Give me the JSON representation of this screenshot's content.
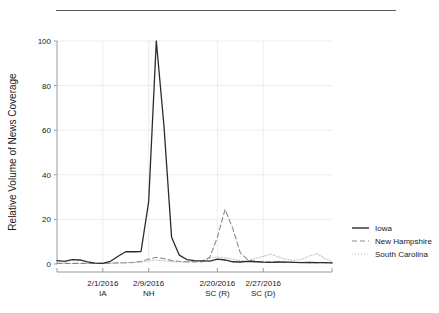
{
  "figure": {
    "top_rule": true,
    "background_color": "#ffffff"
  },
  "chart_data": {
    "type": "line",
    "title": "",
    "subtitle": "",
    "xlabel": "",
    "ylabel": "Relative Volume of News Coverage",
    "ylim": [
      0,
      100
    ],
    "yticks": [
      0,
      20,
      40,
      60,
      80,
      100
    ],
    "ytick_labels": [
      "0",
      "20",
      "40",
      "60",
      "80",
      "100"
    ],
    "xlim": [
      0,
      36
    ],
    "grid": true,
    "grid_color": "#ededed",
    "legend_position": "right",
    "xtick_positions": [
      6,
      12,
      21,
      27
    ],
    "xtick_labels": [
      {
        "date": "2/1/2016",
        "state": "IA"
      },
      {
        "date": "2/9/2016",
        "state": "NH"
      },
      {
        "date": "2/20/2016",
        "state": "SC (R)"
      },
      {
        "date": "2/27/2016",
        "state": "SC (D)"
      }
    ],
    "x": [
      0,
      1,
      2,
      3,
      4,
      5,
      6,
      7,
      8,
      9,
      10,
      11,
      12,
      13,
      14,
      15,
      16,
      17,
      18,
      19,
      20,
      21,
      22,
      23,
      24,
      25,
      26,
      27,
      28,
      29,
      30,
      31,
      32,
      33,
      34,
      35,
      36
    ],
    "series": [
      {
        "name": "Iowa",
        "style": "solid",
        "color": "#2b2b2b",
        "values": [
          1.5,
          1.2,
          2.0,
          1.8,
          1.0,
          0.4,
          0.3,
          1.2,
          3.5,
          5.5,
          5.5,
          5.6,
          28.0,
          100.0,
          62.0,
          12.0,
          4.0,
          2.0,
          1.5,
          1.4,
          1.3,
          2.2,
          1.8,
          1.0,
          0.9,
          1.2,
          1.0,
          0.8,
          0.7,
          0.9,
          0.8,
          0.7,
          0.6,
          0.7,
          0.6,
          0.6,
          0.5
        ]
      },
      {
        "name": "New Hampshire",
        "style": "dashed",
        "color": "#8c8c8c",
        "values": [
          0.3,
          0.3,
          0.3,
          0.3,
          0.3,
          0.3,
          0.3,
          0.4,
          0.5,
          0.6,
          0.8,
          1.2,
          2.2,
          3.0,
          2.4,
          1.6,
          1.2,
          1.0,
          0.9,
          1.0,
          3.0,
          12.0,
          24.5,
          16.0,
          5.0,
          1.8,
          1.2,
          1.0,
          0.9,
          0.8,
          0.8,
          0.7,
          0.7,
          0.6,
          0.6,
          0.6,
          0.5
        ]
      },
      {
        "name": "South Carolina",
        "style": "dotted",
        "color": "#bdbdbd",
        "values": [
          0.2,
          0.2,
          0.2,
          0.2,
          0.2,
          0.2,
          0.2,
          0.3,
          0.4,
          0.5,
          0.6,
          0.8,
          1.4,
          1.8,
          1.4,
          1.0,
          0.9,
          1.0,
          1.2,
          1.6,
          2.6,
          3.2,
          2.8,
          2.2,
          1.6,
          1.4,
          2.6,
          3.4,
          4.4,
          3.2,
          2.0,
          1.6,
          2.0,
          3.6,
          4.6,
          2.6,
          1.2
        ]
      }
    ],
    "legend": [
      {
        "label": "Iowa",
        "style": "solid",
        "color": "#2b2b2b"
      },
      {
        "label": "New Hampshire",
        "style": "dashed",
        "color": "#8c8c8c"
      },
      {
        "label": "South Carolina",
        "style": "dotted",
        "color": "#bdbdbd"
      }
    ]
  }
}
